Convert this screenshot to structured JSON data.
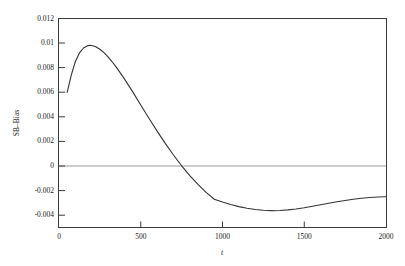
{
  "chart_data": {
    "type": "line",
    "title": "",
    "xlabel": "t",
    "ylabel": "SB–Bias",
    "xlim": [
      0,
      2000
    ],
    "ylim": [
      -0.005,
      0.012
    ],
    "grid": false,
    "legend": null,
    "xticks": [
      0,
      500,
      1000,
      1500,
      2000
    ],
    "xtick_labels": [
      "0",
      "500",
      "1000",
      "1500",
      "2000"
    ],
    "yticks": [
      -0.004,
      -0.002,
      0,
      0.002,
      0.004,
      0.006,
      0.008,
      0.01,
      0.012
    ],
    "ytick_labels": [
      "-0.004",
      "-0.002",
      "0",
      "0.002",
      "0.004",
      "0.006",
      "0.008",
      "0.01",
      "0.012"
    ],
    "reference_lines": [
      {
        "name": "zero-line",
        "orientation": "horizontal",
        "value": 0,
        "color": "#9a9a9a"
      }
    ],
    "series": [
      {
        "name": "SB-Bias curve",
        "color": "#333333",
        "x": [
          50,
          75,
          100,
          125,
          150,
          175,
          190,
          200,
          225,
          250,
          275,
          300,
          325,
          350,
          375,
          400,
          450,
          500,
          550,
          600,
          650,
          700,
          750,
          800,
          850,
          900,
          950,
          1000,
          1050,
          1100,
          1150,
          1200,
          1250,
          1300,
          1320,
          1350,
          1400,
          1450,
          1500,
          1550,
          1600,
          1650,
          1700,
          1750,
          1800,
          1850,
          1900,
          1950,
          2000
        ],
        "y": [
          0.006,
          0.0074,
          0.0085,
          0.0092,
          0.0096,
          0.00979,
          0.00981,
          0.0098,
          0.0097,
          0.0095,
          0.00922,
          0.00888,
          0.00848,
          0.00805,
          0.00758,
          0.00709,
          0.00605,
          0.00497,
          0.00389,
          0.00284,
          0.00184,
          0.0009,
          2e-05,
          -0.00078,
          -0.0015,
          -0.00214,
          -0.0027,
          -0.00293,
          -0.00313,
          -0.0033,
          -0.00344,
          -0.00354,
          -0.0036,
          -0.00363,
          -0.00364,
          -0.00362,
          -0.00357,
          -0.00349,
          -0.00339,
          -0.00327,
          -0.00315,
          -0.00303,
          -0.00291,
          -0.0028,
          -0.0027,
          -0.00262,
          -0.00256,
          -0.00252,
          -0.0025
        ]
      }
    ],
    "annotations": {
      "peak_value": 0.0098,
      "peak_x": 190,
      "zero_crossing_x": 750,
      "minimum_value": -0.00364,
      "minimum_x": 1320,
      "start_value": 0.006,
      "end_value": -0.0025
    }
  }
}
